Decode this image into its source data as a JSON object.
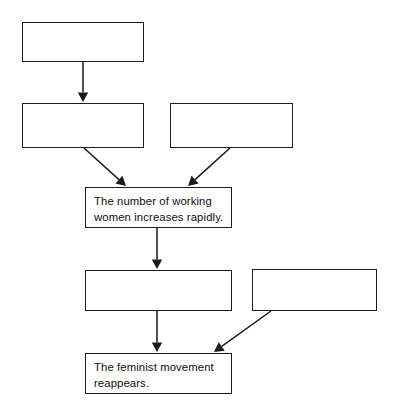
{
  "diagram": {
    "type": "flowchart",
    "title": "",
    "canvas": {
      "width": 395,
      "height": 419,
      "background": "#ffffff"
    },
    "line_color": "#1a1a1a",
    "text_color": "#0d0d0d",
    "nodes": [
      {
        "id": "n1",
        "label": "",
        "empty": true,
        "x": 22,
        "y": 22,
        "w": 122,
        "h": 40
      },
      {
        "id": "n2",
        "label": "",
        "empty": true,
        "x": 22,
        "y": 103,
        "w": 122,
        "h": 45
      },
      {
        "id": "n3",
        "label": "",
        "empty": true,
        "x": 170,
        "y": 103,
        "w": 123,
        "h": 45
      },
      {
        "id": "n4",
        "label": "The number of working\nwomen increases rapidly.",
        "empty": false,
        "x": 85,
        "y": 187,
        "w": 147,
        "h": 41
      },
      {
        "id": "n5",
        "label": "",
        "empty": true,
        "x": 85,
        "y": 270,
        "w": 147,
        "h": 41
      },
      {
        "id": "n6",
        "label": "",
        "empty": true,
        "x": 252,
        "y": 269,
        "w": 125,
        "h": 42
      },
      {
        "id": "n7",
        "label": "The feminist movement\nreappears.",
        "empty": false,
        "x": 85,
        "y": 353,
        "w": 147,
        "h": 41
      }
    ],
    "edges": [
      {
        "id": "e1",
        "from": "n1",
        "to": "n2",
        "kind": "arrow-vertical",
        "x1": 83,
        "y1": 62,
        "x2": 83,
        "y2": 102
      },
      {
        "id": "e2",
        "from": "n2",
        "to": "n4",
        "kind": "arrow-diagonal",
        "x1": 84,
        "y1": 148,
        "x2": 126,
        "y2": 186
      },
      {
        "id": "e3",
        "from": "n3",
        "to": "n4",
        "kind": "arrow-diagonal",
        "x1": 230,
        "y1": 148,
        "x2": 188,
        "y2": 186
      },
      {
        "id": "e4",
        "from": "n4",
        "to": "n5",
        "kind": "arrow-vertical",
        "x1": 157,
        "y1": 228,
        "x2": 157,
        "y2": 269
      },
      {
        "id": "e5",
        "from": "n5",
        "to": "n7",
        "kind": "arrow-vertical",
        "x1": 157,
        "y1": 311,
        "x2": 157,
        "y2": 352
      },
      {
        "id": "e6",
        "from": "n6",
        "to": "n7",
        "kind": "arrow-diagonal",
        "x1": 271,
        "y1": 311,
        "x2": 214,
        "y2": 352
      }
    ]
  }
}
